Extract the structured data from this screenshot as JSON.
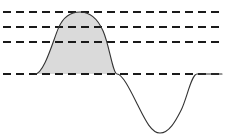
{
  "figure": {
    "width": 230,
    "height": 137,
    "background_color": "#ffffff"
  },
  "chart_data": {
    "type": "line",
    "title": "",
    "subtitle": "",
    "xlabel": "",
    "ylabel": "",
    "xlim": [
      0,
      230
    ],
    "ylim": [
      137,
      0
    ],
    "grid": true,
    "grid_orientation": "horizontal",
    "legend": false,
    "legend_position": "none",
    "annotations": [],
    "tick_labels": {
      "x": [],
      "y": []
    },
    "gridlines": {
      "count": 4,
      "color": "#1a1a1a",
      "dash_pattern": "8 5",
      "stroke_width": 1.6,
      "x_start": 3,
      "x_end": 222,
      "y_values": [
        12,
        27,
        42,
        74
      ],
      "labels": [
        "level-1-top",
        "level-2",
        "level-3",
        "baseline"
      ]
    },
    "series": [
      {
        "name": "sine-wave",
        "stroke_color": "#333333",
        "stroke_width": 1.1,
        "path": "M 35 74 C 44.1 74 53.2 40.1 58.5 27.9 C 63.8 15.7 71.1 12 80 12 C 88.9 12 97.0 17.1 103.2 31.2 C 109.4 45.3 112.9 74 117 74 C 122.5 74 130.6 90.8 137.6 104.8 C 144.6 118.8 151.1 133 160 133 C 168.9 133 175.4 121.6 181.2 110.0 C 187.0 98.4 191.4 74 197 74 C 204.5 74 212.0 74 222 74",
        "key_points": [
          {
            "label": "left-zero-crossing",
            "x": 35,
            "y": 74
          },
          {
            "label": "crest",
            "x": 80,
            "y": 12
          },
          {
            "label": "mid-zero-crossing",
            "x": 117,
            "y": 74
          },
          {
            "label": "trough",
            "x": 160,
            "y": 133
          },
          {
            "label": "right-zero-crossing",
            "x": 197,
            "y": 74
          }
        ]
      }
    ],
    "shaded_region": {
      "name": "positive-half-cycle-fill",
      "fill_color": "#dadada",
      "x_start": 35,
      "x_end": 117,
      "baseline_y": 74,
      "path": "M 35 74 C 44.1 74 53.2 40.1 58.5 27.9 C 63.8 15.7 71.1 12 80 12 C 88.9 12 97.0 17.1 103.2 31.2 C 109.4 45.3 112.9 74 117 74 Z"
    }
  }
}
